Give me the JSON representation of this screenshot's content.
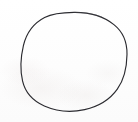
{
  "canvas": {
    "width": 138,
    "height": 122,
    "background_color": "#fefefe",
    "paper_tint_color": "#f8f6f5",
    "alt_text": "Hand-drawn circle sketch on blank paper"
  },
  "drawing": {
    "title": "circle",
    "shape_label": "circle",
    "stroke_color": "#2b2b30",
    "stroke_width": 1.15,
    "fill": "none",
    "style": "hand-drawn single continuous outline",
    "geometry": {
      "center_x": 74.5,
      "center_y": 61.5,
      "radius_x": 52.5,
      "radius_y": 49.5,
      "bounds": {
        "left": 22,
        "top": 12,
        "right": 127,
        "bottom": 111
      }
    },
    "path_d": "M 74.0 12.4 C 89.5 12.2 103.8 16.6 113.9 24.6 C 123.2 32.0 127.2 42.5 127.0 54.4 C 126.8 67.3 124.2 79.4 117.3 89.1 C 110.0 99.4 98.0 106.6 84.6 109.6 C 71.0 112.6 56.4 111.3 44.3 106.0 C 33.0 101.0 25.2 92.4 22.6 81.2 C 20.0 70.0 20.7 57.0 23.4 45.6 C 26.3 33.4 33.6 23.2 44.6 17.5 C 53.6 12.8 63.5 12.5 74.0 12.4 Z",
    "accent_path_d": "M 74.0 12.4 C 84.0 12.3 93.4 13.7 101.6 16.9"
  },
  "annotations": {
    "text_items": [],
    "labels": []
  }
}
